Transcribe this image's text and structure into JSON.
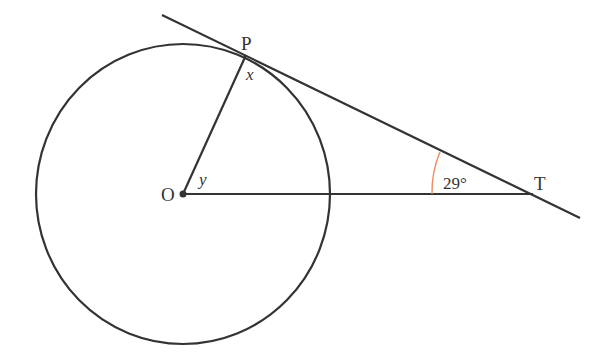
{
  "diagram": {
    "type": "circle-tangent-geometry",
    "colors": {
      "stroke": "#333333",
      "angle_arc": "#f08a5d",
      "background": "#ffffff"
    },
    "points": {
      "O": {
        "label": "O",
        "x": 183,
        "y": 194
      },
      "P": {
        "label": "P",
        "x": 246,
        "y": 55
      },
      "T": {
        "label": "T",
        "x": 533,
        "y": 194
      }
    },
    "circle": {
      "center": "O",
      "rx": 147,
      "ry": 150
    },
    "tangent_line": {
      "from": [
        162,
        15
      ],
      "to": [
        580,
        218
      ]
    },
    "segments": [
      {
        "name": "radius-OP",
        "from": "O",
        "to": "P"
      },
      {
        "name": "line-OT",
        "from": "O",
        "to": "T"
      }
    ],
    "angles": {
      "x": {
        "label": "x",
        "at": "P"
      },
      "y": {
        "label": "y",
        "at": "O"
      },
      "T": {
        "label": "29°",
        "at": "T",
        "value_deg": 29
      }
    }
  }
}
